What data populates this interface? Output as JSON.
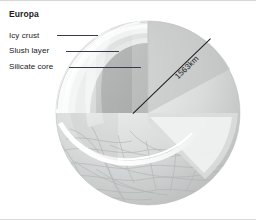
{
  "figure": {
    "title": "Europa",
    "type": "cutaway-cross-section-diagram"
  },
  "callouts": [
    {
      "key": "icy_crust",
      "label": "Icy crust"
    },
    {
      "key": "slush_layer",
      "label": "Slush layer"
    },
    {
      "key": "silicate_core",
      "label": "Silicate core"
    }
  ],
  "measurement": {
    "label": "1563km",
    "describes": "diameter"
  },
  "layers": {
    "crust_color": "#f4f4f4",
    "slush_color": "#dcdcdc",
    "core_color": "#a9abab",
    "surface_color": "#c9cbcb",
    "leader_color": "#3a3a46",
    "text_color": "#1a1a1a"
  }
}
